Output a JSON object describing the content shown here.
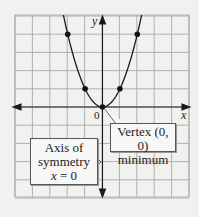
{
  "figure": {
    "axis_labels": {
      "x": "x",
      "y": "y",
      "origin": "0"
    },
    "callouts": {
      "vertex": {
        "line1": "Vertex (0, 0)",
        "line2": "minimum"
      },
      "axis": {
        "line1": "Axis of",
        "line2": "symmetry",
        "line3_var": "x",
        "line3_rest": " = 0"
      }
    },
    "colors": {
      "background": "#f1f1ef",
      "grid": "#a9a9a9",
      "curve": "#1a1a1a",
      "point": "#111111"
    }
  },
  "chart_data": {
    "type": "line",
    "title": "",
    "function": "y = x^2",
    "x": [
      -2,
      -1,
      0,
      1,
      2
    ],
    "y": [
      4,
      1,
      0,
      1,
      4
    ],
    "marked_points": [
      [
        -2,
        4
      ],
      [
        -1,
        1
      ],
      [
        0,
        0
      ],
      [
        1,
        1
      ],
      [
        2,
        4
      ]
    ],
    "xlabel": "x",
    "ylabel": "y",
    "xlim": [
      -5,
      5
    ],
    "ylim": [
      -5,
      5
    ],
    "grid": true,
    "annotations": [
      {
        "text": "Vertex (0, 0) minimum",
        "points_to": [
          0,
          0
        ]
      },
      {
        "text": "Axis of symmetry x = 0",
        "points_to": "y-axis"
      }
    ]
  }
}
